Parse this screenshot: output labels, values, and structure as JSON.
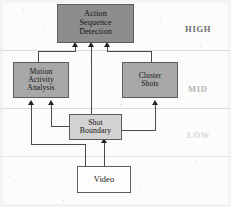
{
  "diagram": {
    "nodes": [
      {
        "id": "action-sequence-detection",
        "lines": [
          "Action",
          "Sequence",
          "Detection"
        ],
        "tier": "HIGH",
        "fill": "#8d8d8d"
      },
      {
        "id": "motion-activity-analysis",
        "lines": [
          "Motion",
          "Activity",
          "Analysis"
        ],
        "tier": "MID",
        "fill": "#a8a8a8"
      },
      {
        "id": "cluster-shots",
        "lines": [
          "Cluster",
          "Shots"
        ],
        "tier": "MID",
        "fill": "#a8a8a8"
      },
      {
        "id": "shot-boundary",
        "lines": [
          "Shot",
          "Boundary"
        ],
        "tier": "LOW",
        "fill": "#d2d2d2"
      },
      {
        "id": "video",
        "lines": [
          "Video"
        ],
        "tier": "SOURCE",
        "fill": "#fdfdfd"
      }
    ],
    "tier_labels": [
      {
        "id": "high",
        "text": "HIGH"
      },
      {
        "id": "mid",
        "text": "MID"
      },
      {
        "id": "low",
        "text": "LOW"
      }
    ],
    "edges": [
      {
        "from": "motion-activity-analysis",
        "to": "action-sequence-detection"
      },
      {
        "from": "shot-boundary",
        "to": "action-sequence-detection"
      },
      {
        "from": "cluster-shots",
        "to": "action-sequence-detection"
      },
      {
        "from": "shot-boundary",
        "to": "motion-activity-analysis"
      },
      {
        "from": "video",
        "to": "motion-activity-analysis"
      },
      {
        "from": "shot-boundary",
        "to": "cluster-shots"
      },
      {
        "from": "video",
        "to": "shot-boundary"
      }
    ]
  }
}
